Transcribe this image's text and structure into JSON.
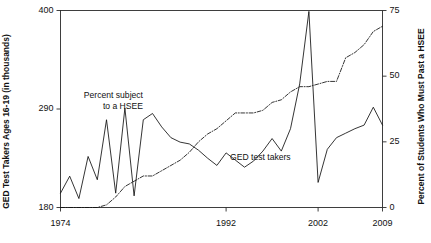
{
  "chart_data": {
    "type": "line",
    "title": "",
    "subtitle": "",
    "xlabel": "",
    "ylabel": "GED Test Takers Ages 16-19 (in thousands)",
    "ylabel_right": "Percent of Students Who Must Past a HSEE",
    "xlim": [
      1974,
      2009
    ],
    "ylim": [
      180,
      400
    ],
    "ylim_right": [
      0,
      75
    ],
    "grid": false,
    "legend_position": "inline-annotations",
    "xticks": [
      1974,
      1992,
      2002,
      2009
    ],
    "xticklabels": [
      "1974",
      "1992",
      "2002",
      "2009"
    ],
    "yticks_left": [
      180,
      290,
      400
    ],
    "yticklabels_left": [
      "180",
      "290",
      "400"
    ],
    "yticks_right": [
      0,
      25,
      50,
      75
    ],
    "yticklabels_right": [
      "0",
      "25",
      "50",
      "75"
    ],
    "x": [
      1974,
      1975,
      1976,
      1977,
      1978,
      1979,
      1980,
      1981,
      1982,
      1983,
      1984,
      1985,
      1986,
      1987,
      1988,
      1989,
      1990,
      1991,
      1992,
      1993,
      1994,
      1995,
      1996,
      1997,
      1998,
      1999,
      2000,
      2001,
      2002,
      2003,
      2004,
      2005,
      2006,
      2007,
      2008,
      2009
    ],
    "series": [
      {
        "name": "GED test takers",
        "axis": "left",
        "style": "solid",
        "color": "#111111",
        "units": "thousands",
        "values": [
          196,
          215,
          190,
          237,
          211,
          278,
          196,
          291,
          193,
          278,
          285,
          270,
          258,
          253,
          251,
          244,
          235,
          227,
          241,
          233,
          225,
          232,
          243,
          257,
          243,
          268,
          318,
          399,
          208,
          245,
          258,
          263,
          268,
          272,
          292,
          272
        ]
      },
      {
        "name": "Percent subject to a HSEE",
        "axis": "right",
        "style": "dash-dot",
        "color": "#111111",
        "units": "percent",
        "values": [
          0,
          0,
          0,
          0,
          0,
          1,
          4,
          8,
          10,
          12,
          12,
          14,
          16,
          18,
          21,
          25,
          28,
          30,
          33,
          36,
          36,
          36,
          37,
          40,
          41,
          44,
          46,
          46,
          47,
          48,
          48,
          57,
          59,
          62,
          67,
          69
        ]
      }
    ],
    "annotations": [
      {
        "name": "hsee-annotation",
        "lines": [
          "Percent subject",
          "to a HSEE"
        ],
        "x_px": 105,
        "y_px": 90
      },
      {
        "name": "ged-annotation",
        "lines": [
          "GED test takers"
        ],
        "x_px": 230,
        "y_px": 152
      }
    ]
  }
}
